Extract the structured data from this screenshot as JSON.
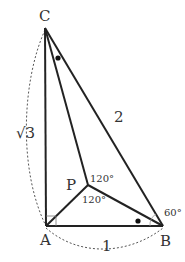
{
  "diagram": {
    "type": "geometry",
    "colors": {
      "line": "#222222",
      "dashed": "#555555",
      "text": "#333333",
      "background": "#ffffff"
    },
    "points": {
      "C": {
        "label": "C",
        "x": 45,
        "y": 28
      },
      "A": {
        "label": "A",
        "x": 46,
        "y": 226
      },
      "B": {
        "label": "B",
        "x": 163,
        "y": 226
      },
      "P": {
        "label": "P",
        "x": 88,
        "y": 185
      }
    },
    "segments": [
      {
        "from": "C",
        "to": "A"
      },
      {
        "from": "A",
        "to": "B"
      },
      {
        "from": "C",
        "to": "B"
      },
      {
        "from": "P",
        "to": "A"
      },
      {
        "from": "P",
        "to": "B"
      },
      {
        "from": "P",
        "to": "C"
      }
    ],
    "side_labels": {
      "CA": "√3",
      "CB": "2",
      "AB": "1"
    },
    "angle_labels": {
      "CPB": "120°",
      "APB": "120°",
      "ABC": "60°"
    },
    "right_angle_at": "A",
    "equal_angle_marks": [
      "ACP",
      "PBA"
    ]
  }
}
